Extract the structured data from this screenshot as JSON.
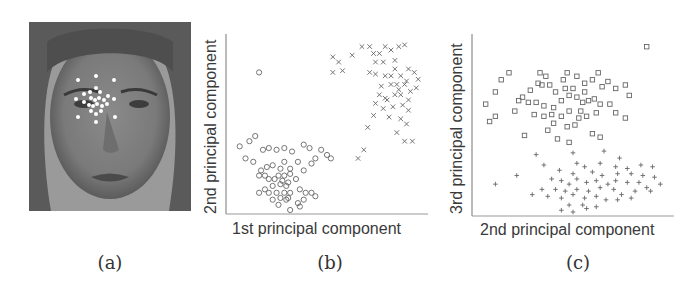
{
  "figure": {
    "panels": [
      {
        "id": "a",
        "caption": "(a)",
        "description": "Grayscale face photograph with white landmark dots around the left eye"
      },
      {
        "id": "b",
        "caption": "(b)"
      },
      {
        "id": "c",
        "caption": "(c)"
      }
    ]
  },
  "chart_data": [
    {
      "type": "scatter",
      "panel": "(b)",
      "title": "",
      "xlabel": "1st principal component",
      "ylabel": "2nd principal component",
      "grid": false,
      "ticks": false,
      "legend": null,
      "series": [
        {
          "name": "cluster-x",
          "marker": "x",
          "points": [
            [
              0.56,
              0.14
            ],
            [
              0.68,
              0.05
            ],
            [
              0.72,
              0.05
            ],
            [
              0.8,
              0.05
            ],
            [
              0.77,
              0.09
            ],
            [
              0.53,
              0.11
            ],
            [
              0.63,
              0.1
            ],
            [
              0.58,
              0.19
            ],
            [
              0.53,
              0.2
            ],
            [
              0.74,
              0.09
            ],
            [
              0.75,
              0.14
            ],
            [
              0.79,
              0.14
            ],
            [
              0.83,
              0.07
            ],
            [
              0.87,
              0.05
            ],
            [
              0.9,
              0.04
            ],
            [
              0.85,
              0.13
            ],
            [
              0.85,
              0.18
            ],
            [
              0.72,
              0.2
            ],
            [
              0.75,
              0.21
            ],
            [
              0.8,
              0.22
            ],
            [
              0.88,
              0.22
            ],
            [
              0.92,
              0.18
            ],
            [
              0.95,
              0.2
            ],
            [
              0.97,
              0.24
            ],
            [
              0.78,
              0.28
            ],
            [
              0.83,
              0.27
            ],
            [
              0.86,
              0.27
            ],
            [
              0.9,
              0.27
            ],
            [
              0.93,
              0.31
            ],
            [
              0.96,
              0.29
            ],
            [
              0.77,
              0.33
            ],
            [
              0.8,
              0.35
            ],
            [
              0.85,
              0.33
            ],
            [
              0.88,
              0.33
            ],
            [
              0.92,
              0.36
            ],
            [
              0.75,
              0.38
            ],
            [
              0.79,
              0.41
            ],
            [
              0.84,
              0.4
            ],
            [
              0.89,
              0.39
            ],
            [
              0.92,
              0.42
            ],
            [
              0.74,
              0.45
            ],
            [
              0.82,
              0.46
            ],
            [
              0.88,
              0.47
            ],
            [
              0.91,
              0.5
            ],
            [
              0.71,
              0.52
            ],
            [
              0.86,
              0.55
            ],
            [
              0.9,
              0.6
            ],
            [
              0.94,
              0.6
            ],
            [
              0.69,
              0.65
            ],
            [
              0.66,
              0.7
            ],
            [
              0.81,
              0.36
            ],
            [
              0.87,
              0.3
            ],
            [
              0.83,
              0.22
            ],
            [
              0.91,
              0.25
            ]
          ]
        },
        {
          "name": "cluster-o",
          "marker": "o",
          "points": [
            [
              0.15,
              0.2
            ],
            [
              0.05,
              0.63
            ],
            [
              0.1,
              0.6
            ],
            [
              0.13,
              0.57
            ],
            [
              0.08,
              0.7
            ],
            [
              0.12,
              0.72
            ],
            [
              0.17,
              0.65
            ],
            [
              0.2,
              0.64
            ],
            [
              0.24,
              0.65
            ],
            [
              0.28,
              0.64
            ],
            [
              0.32,
              0.66
            ],
            [
              0.38,
              0.62
            ],
            [
              0.41,
              0.64
            ],
            [
              0.47,
              0.65
            ],
            [
              0.5,
              0.68
            ],
            [
              0.52,
              0.7
            ],
            [
              0.44,
              0.7
            ],
            [
              0.42,
              0.73
            ],
            [
              0.38,
              0.77
            ],
            [
              0.35,
              0.72
            ],
            [
              0.31,
              0.76
            ],
            [
              0.28,
              0.72
            ],
            [
              0.26,
              0.76
            ],
            [
              0.22,
              0.74
            ],
            [
              0.19,
              0.75
            ],
            [
              0.16,
              0.77
            ],
            [
              0.15,
              0.8
            ],
            [
              0.18,
              0.8
            ],
            [
              0.2,
              0.82
            ],
            [
              0.25,
              0.8
            ],
            [
              0.28,
              0.8
            ],
            [
              0.31,
              0.79
            ],
            [
              0.34,
              0.82
            ],
            [
              0.22,
              0.86
            ],
            [
              0.26,
              0.85
            ],
            [
              0.29,
              0.86
            ],
            [
              0.18,
              0.88
            ],
            [
              0.15,
              0.9
            ],
            [
              0.2,
              0.9
            ],
            [
              0.24,
              0.9
            ],
            [
              0.28,
              0.9
            ],
            [
              0.31,
              0.9
            ],
            [
              0.36,
              0.88
            ],
            [
              0.39,
              0.9
            ],
            [
              0.42,
              0.9
            ],
            [
              0.44,
              0.92
            ],
            [
              0.22,
              0.94
            ],
            [
              0.26,
              0.93
            ],
            [
              0.3,
              0.93
            ],
            [
              0.35,
              0.96
            ],
            [
              0.38,
              0.94
            ],
            [
              0.25,
              0.97
            ],
            [
              0.31,
              1.0
            ],
            [
              0.36,
              0.98
            ],
            [
              0.27,
              0.83
            ],
            [
              0.3,
              0.84
            ],
            [
              0.23,
              0.82
            ],
            [
              0.29,
              0.94
            ]
          ]
        }
      ]
    },
    {
      "type": "scatter",
      "panel": "(c)",
      "title": "",
      "xlabel": "2nd principal component",
      "ylabel": "3rd principal component",
      "grid": false,
      "ticks": false,
      "legend": null,
      "series": [
        {
          "name": "cluster-square",
          "marker": "square",
          "points": [
            [
              0.88,
              0.05
            ],
            [
              0.63,
              0.2
            ],
            [
              0.05,
              0.38
            ],
            [
              0.1,
              0.31
            ],
            [
              0.13,
              0.24
            ],
            [
              0.17,
              0.2
            ],
            [
              0.07,
              0.48
            ],
            [
              0.1,
              0.45
            ],
            [
              0.2,
              0.42
            ],
            [
              0.24,
              0.34
            ],
            [
              0.28,
              0.3
            ],
            [
              0.32,
              0.26
            ],
            [
              0.33,
              0.2
            ],
            [
              0.36,
              0.22
            ],
            [
              0.34,
              0.27
            ],
            [
              0.38,
              0.27
            ],
            [
              0.41,
              0.31
            ],
            [
              0.45,
              0.24
            ],
            [
              0.47,
              0.2
            ],
            [
              0.52,
              0.22
            ],
            [
              0.56,
              0.26
            ],
            [
              0.6,
              0.24
            ],
            [
              0.65,
              0.28
            ],
            [
              0.68,
              0.25
            ],
            [
              0.72,
              0.29
            ],
            [
              0.77,
              0.27
            ],
            [
              0.79,
              0.33
            ],
            [
              0.22,
              0.36
            ],
            [
              0.27,
              0.37
            ],
            [
              0.31,
              0.37
            ],
            [
              0.35,
              0.39
            ],
            [
              0.4,
              0.4
            ],
            [
              0.44,
              0.36
            ],
            [
              0.48,
              0.33
            ],
            [
              0.52,
              0.34
            ],
            [
              0.55,
              0.37
            ],
            [
              0.58,
              0.36
            ],
            [
              0.61,
              0.35
            ],
            [
              0.64,
              0.38
            ],
            [
              0.69,
              0.38
            ],
            [
              0.3,
              0.44
            ],
            [
              0.35,
              0.45
            ],
            [
              0.39,
              0.44
            ],
            [
              0.44,
              0.45
            ],
            [
              0.48,
              0.42
            ],
            [
              0.54,
              0.42
            ],
            [
              0.57,
              0.45
            ],
            [
              0.62,
              0.43
            ],
            [
              0.72,
              0.43
            ],
            [
              0.77,
              0.46
            ],
            [
              0.4,
              0.49
            ],
            [
              0.47,
              0.51
            ],
            [
              0.51,
              0.5
            ],
            [
              0.37,
              0.53
            ],
            [
              0.25,
              0.56
            ],
            [
              0.42,
              0.58
            ],
            [
              0.48,
              0.6
            ],
            [
              0.6,
              0.55
            ],
            [
              0.64,
              0.57
            ],
            [
              0.56,
              0.31
            ],
            [
              0.5,
              0.29
            ],
            [
              0.46,
              0.29
            ],
            [
              0.53,
              0.46
            ]
          ]
        },
        {
          "name": "cluster-plus",
          "marker": "plus",
          "points": [
            [
              0.31,
              0.67
            ],
            [
              0.5,
              0.66
            ],
            [
              0.66,
              0.65
            ],
            [
              0.74,
              0.69
            ],
            [
              0.35,
              0.73
            ],
            [
              0.52,
              0.72
            ],
            [
              0.56,
              0.74
            ],
            [
              0.64,
              0.72
            ],
            [
              0.72,
              0.74
            ],
            [
              0.78,
              0.75
            ],
            [
              0.85,
              0.73
            ],
            [
              0.91,
              0.74
            ],
            [
              0.21,
              0.79
            ],
            [
              0.43,
              0.76
            ],
            [
              0.5,
              0.78
            ],
            [
              0.6,
              0.77
            ],
            [
              0.65,
              0.79
            ],
            [
              0.73,
              0.78
            ],
            [
              0.8,
              0.78
            ],
            [
              0.86,
              0.79
            ],
            [
              0.92,
              0.8
            ],
            [
              0.1,
              0.84
            ],
            [
              0.39,
              0.81
            ],
            [
              0.44,
              0.82
            ],
            [
              0.48,
              0.84
            ],
            [
              0.52,
              0.81
            ],
            [
              0.57,
              0.83
            ],
            [
              0.62,
              0.82
            ],
            [
              0.68,
              0.84
            ],
            [
              0.72,
              0.82
            ],
            [
              0.78,
              0.83
            ],
            [
              0.84,
              0.83
            ],
            [
              0.88,
              0.86
            ],
            [
              0.95,
              0.84
            ],
            [
              0.34,
              0.87
            ],
            [
              0.41,
              0.87
            ],
            [
              0.46,
              0.88
            ],
            [
              0.52,
              0.87
            ],
            [
              0.58,
              0.88
            ],
            [
              0.64,
              0.86
            ],
            [
              0.71,
              0.87
            ],
            [
              0.75,
              0.9
            ],
            [
              0.82,
              0.88
            ],
            [
              0.9,
              0.88
            ],
            [
              0.29,
              0.9
            ],
            [
              0.37,
              0.91
            ],
            [
              0.44,
              0.92
            ],
            [
              0.5,
              0.9
            ],
            [
              0.56,
              0.92
            ],
            [
              0.62,
              0.91
            ],
            [
              0.67,
              0.93
            ],
            [
              0.73,
              0.93
            ],
            [
              0.8,
              0.92
            ],
            [
              0.48,
              0.96
            ],
            [
              0.55,
              0.96
            ],
            [
              0.62,
              0.97
            ],
            [
              0.44,
              0.99
            ],
            [
              0.5,
              1.0
            ],
            [
              0.57,
              0.98
            ]
          ]
        }
      ]
    }
  ]
}
